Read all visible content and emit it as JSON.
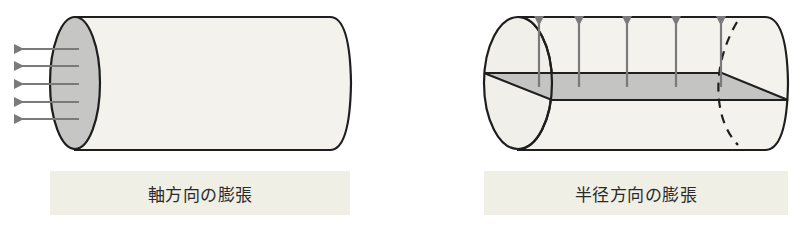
{
  "panels": [
    {
      "id": "axial",
      "caption": "軸方向の膨張",
      "description": "cylinder with arrows pointing outward along the axis from the shaded end face",
      "arrow_count": 5,
      "arrow_direction": "left"
    },
    {
      "id": "radial",
      "caption": "半径方向の膨張",
      "description": "cylinder with shaded longitudinal plane and arrows pointing outward perpendicular to the axis",
      "arrow_count": 5,
      "arrow_direction": "up"
    }
  ],
  "colors": {
    "cylinder_fill": "#f3f2ec",
    "end_face_fill": "#c6c6c4",
    "plane_fill": "#c4c4c2",
    "outline": "#1e1e1e",
    "arrow": "#7a7a7a",
    "label_bg": "#f0efe6",
    "label_text": "#2a2a2a"
  }
}
